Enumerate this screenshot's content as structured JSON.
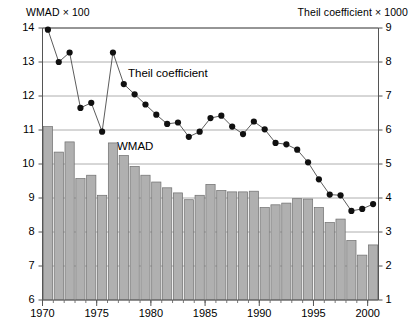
{
  "axes": {
    "left_caption": "WMAD × 100",
    "right_caption": "Theil coefficient × 1000",
    "left_ticks": [
      "14",
      "13",
      "12",
      "11",
      "10",
      "9",
      "8",
      "7",
      "6"
    ],
    "right_ticks": [
      "9",
      "8",
      "7",
      "6",
      "5",
      "4",
      "3",
      "2",
      "1"
    ],
    "x_ticks": [
      "1970",
      "1975",
      "1980",
      "1985",
      "1990",
      "1995",
      "2000"
    ]
  },
  "series_labels": {
    "theil": "Theil coefficient",
    "wmad": "WMAD"
  },
  "colors": {
    "bar_fill": "#b0b0b0",
    "bar_stroke": "#6e6e6e",
    "marker": "#101010",
    "line": "#4a4a4a",
    "grid": "#9a9a9a",
    "frame": "#555555",
    "text": "#000000"
  },
  "chart_data": {
    "type": "bar",
    "title": "",
    "subtitle": "",
    "xlabel": "",
    "ylabel": "WMAD × 100",
    "y2label": "Theil coefficient × 1000",
    "grid": true,
    "legend": "inline-annotations",
    "x": [
      1970,
      1971,
      1972,
      1973,
      1974,
      1975,
      1976,
      1977,
      1978,
      1979,
      1980,
      1981,
      1982,
      1983,
      1984,
      1985,
      1986,
      1987,
      1988,
      1989,
      1990,
      1991,
      1992,
      1993,
      1994,
      1995,
      1996,
      1997,
      1998,
      1999,
      2000
    ],
    "xtick_values": [
      1970,
      1975,
      1980,
      1985,
      1990,
      1995,
      2000
    ],
    "ylim": [
      6,
      14
    ],
    "y2lim": [
      1,
      9
    ],
    "series": [
      {
        "name": "WMAD",
        "type": "bar",
        "axis": "left",
        "unit": "× 100",
        "values": [
          11.1,
          10.35,
          10.65,
          9.57,
          9.67,
          9.08,
          10.62,
          10.25,
          9.93,
          9.67,
          9.47,
          9.3,
          9.15,
          8.95,
          9.08,
          9.4,
          9.22,
          9.18,
          9.18,
          9.2,
          8.72,
          8.8,
          8.85,
          8.98,
          8.97,
          8.72,
          8.28,
          8.38,
          7.75,
          7.32,
          7.62
        ]
      },
      {
        "name": "Theil coefficient",
        "type": "line",
        "axis": "right",
        "unit": "× 1000",
        "values": [
          8.95,
          8.0,
          8.28,
          6.65,
          6.8,
          5.95,
          8.28,
          7.35,
          7.05,
          6.75,
          6.45,
          6.18,
          6.22,
          5.8,
          5.95,
          6.35,
          6.42,
          6.1,
          5.88,
          6.25,
          6.02,
          5.62,
          5.58,
          5.42,
          5.05,
          4.55,
          4.1,
          4.08,
          3.62,
          3.68,
          3.82
        ]
      }
    ]
  }
}
